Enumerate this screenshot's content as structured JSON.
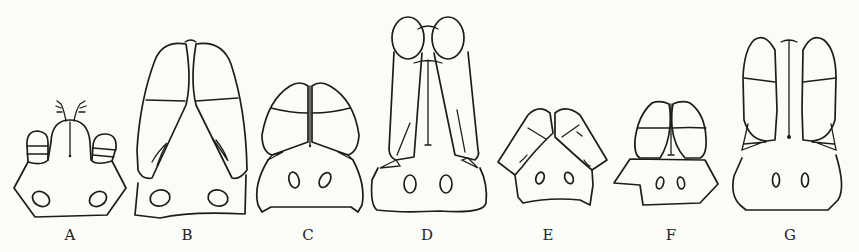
{
  "figure": {
    "panels": [
      {
        "id": "A",
        "label": "A",
        "x": 70
      },
      {
        "id": "B",
        "label": "B",
        "x": 187
      },
      {
        "id": "C",
        "label": "C",
        "x": 308
      },
      {
        "id": "D",
        "label": "D",
        "x": 427
      },
      {
        "id": "E",
        "label": "E",
        "x": 548
      },
      {
        "id": "F",
        "label": "F",
        "x": 671
      },
      {
        "id": "G",
        "label": "G",
        "x": 790
      }
    ]
  }
}
